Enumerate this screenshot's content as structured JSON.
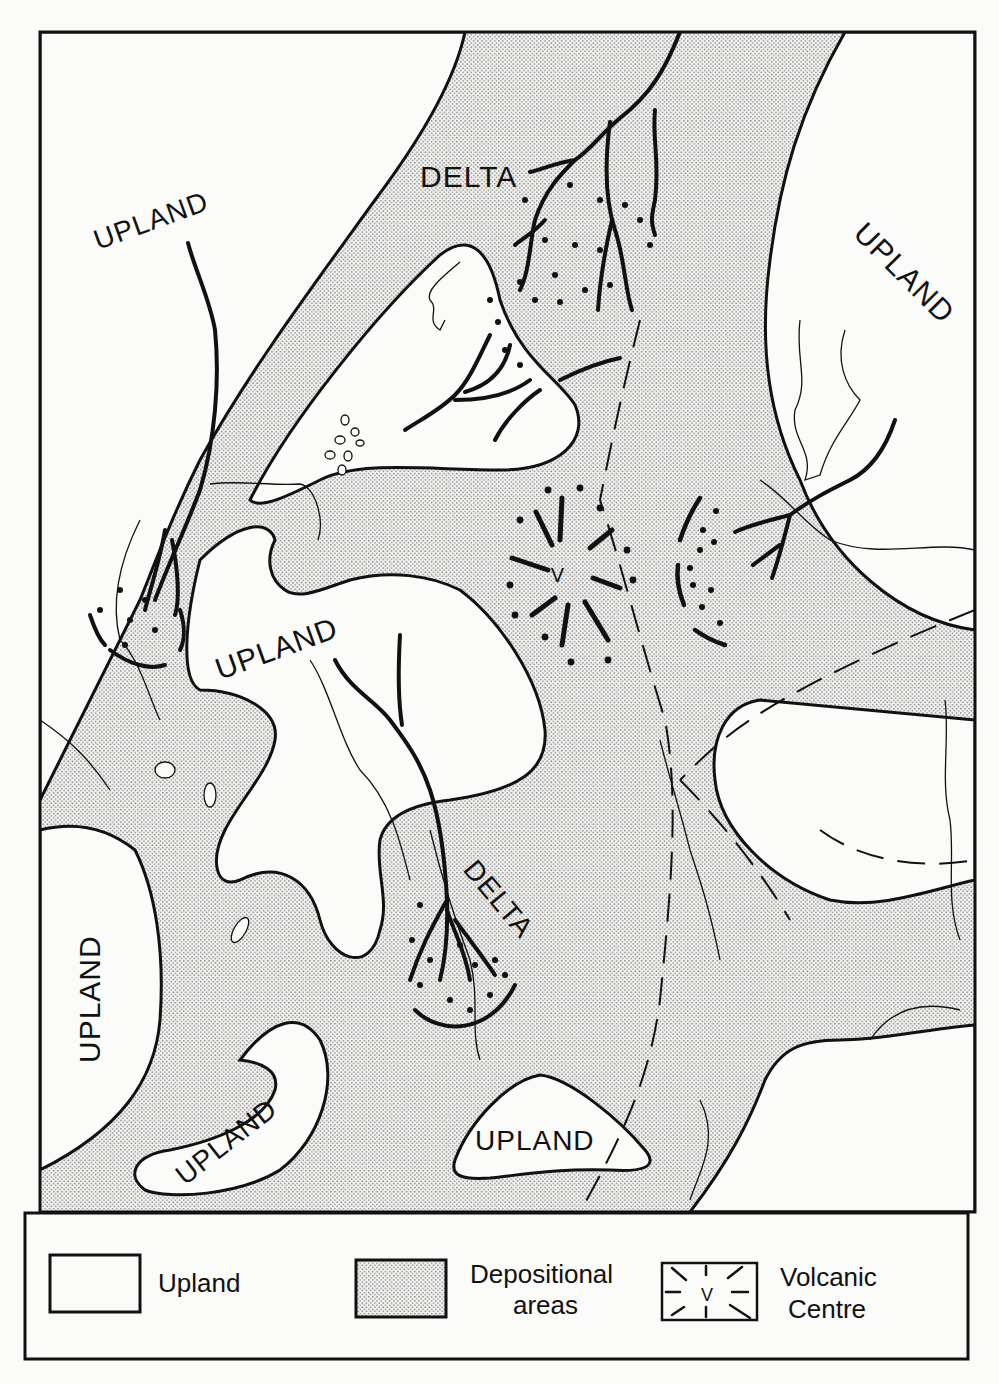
{
  "map": {
    "labels": {
      "upland_nw": "UPLAND",
      "upland_ne": "UPLAND",
      "upland_center": "UPLAND",
      "upland_west": "UPLAND",
      "upland_sw": "UPLAND",
      "upland_south": "UPLAND",
      "delta_north": "DELTA",
      "delta_south": "DELTA",
      "volcanic_v": "V"
    },
    "colors": {
      "upland_fill": "#fbfbf9",
      "depositional_dot": "#8a8a8a",
      "line": "#111111"
    }
  },
  "legend": {
    "items": [
      {
        "label": "Upland",
        "symbol": "empty-box"
      },
      {
        "label_line1": "Depositional",
        "label_line2": "areas",
        "symbol": "stippled-box"
      },
      {
        "label_line1": "Volcanic",
        "label_line2": "Centre",
        "symbol": "volcanic-v-box",
        "symbol_text": "V"
      }
    ]
  }
}
